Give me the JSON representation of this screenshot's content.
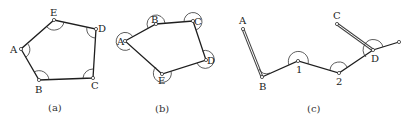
{
  "figure": {
    "panels": [
      {
        "id": "a",
        "caption": "(a)",
        "description": "closed traverse, interior angles",
        "points": [
          {
            "name": "A",
            "x": 21,
            "y": 49
          },
          {
            "name": "B",
            "x": 39,
            "y": 80
          },
          {
            "name": "C",
            "x": 93,
            "y": 78
          },
          {
            "name": "D",
            "x": 96,
            "y": 29
          },
          {
            "name": "E",
            "x": 54,
            "y": 20
          }
        ]
      },
      {
        "id": "b",
        "caption": "(b)",
        "description": "closed traverse, exterior angles",
        "points": [
          {
            "name": "A",
            "x": 125,
            "y": 41
          },
          {
            "name": "B",
            "x": 156,
            "y": 24
          },
          {
            "name": "C",
            "x": 193,
            "y": 21
          },
          {
            "name": "D",
            "x": 206,
            "y": 60
          },
          {
            "name": "E",
            "x": 162,
            "y": 74
          }
        ]
      },
      {
        "id": "c",
        "caption": "(c)",
        "description": "connecting traverse between known lines AB and CD",
        "points": [
          {
            "name": "A",
            "x": 243,
            "y": 29
          },
          {
            "name": "B",
            "x": 262,
            "y": 77
          },
          {
            "name": "1",
            "x": 298,
            "y": 61
          },
          {
            "name": "2",
            "x": 339,
            "y": 73
          },
          {
            "name": "D",
            "x": 373,
            "y": 50
          },
          {
            "name": "C",
            "x": 337,
            "y": 24
          }
        ]
      }
    ]
  },
  "labels": {
    "a": {
      "A": "A",
      "B": "B",
      "C": "C",
      "D": "D",
      "E": "E",
      "caption": "(a)"
    },
    "b": {
      "A": "A",
      "B": "B",
      "C": "C",
      "D": "D",
      "E": "E",
      "caption": "(b)"
    },
    "c": {
      "A": "A",
      "B": "B",
      "p1": "1",
      "p2": "2",
      "C": "C",
      "D": "D",
      "caption": "(c)"
    }
  }
}
